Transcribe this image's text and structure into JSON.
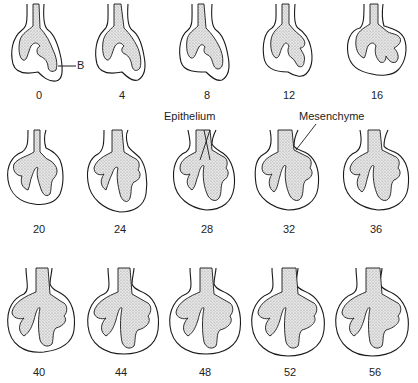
{
  "figure": {
    "panels": [
      {
        "label": "0",
        "row": 0,
        "col": 0,
        "stage": 0
      },
      {
        "label": "4",
        "row": 0,
        "col": 1,
        "stage": 1
      },
      {
        "label": "8",
        "row": 0,
        "col": 2,
        "stage": 2
      },
      {
        "label": "12",
        "row": 0,
        "col": 3,
        "stage": 3
      },
      {
        "label": "16",
        "row": 0,
        "col": 4,
        "stage": 4
      },
      {
        "label": "20",
        "row": 1,
        "col": 0,
        "stage": 5
      },
      {
        "label": "24",
        "row": 1,
        "col": 1,
        "stage": 6
      },
      {
        "label": "28",
        "row": 1,
        "col": 2,
        "stage": 7
      },
      {
        "label": "32",
        "row": 1,
        "col": 3,
        "stage": 8
      },
      {
        "label": "36",
        "row": 1,
        "col": 4,
        "stage": 9
      },
      {
        "label": "40",
        "row": 2,
        "col": 0,
        "stage": 10
      },
      {
        "label": "44",
        "row": 2,
        "col": 1,
        "stage": 11
      },
      {
        "label": "48",
        "row": 2,
        "col": 2,
        "stage": 12
      },
      {
        "label": "52",
        "row": 2,
        "col": 3,
        "stage": 13
      },
      {
        "label": "56",
        "row": 2,
        "col": 4,
        "stage": 14
      }
    ],
    "annotations": {
      "bud": "B",
      "epithelium": "Epithelium",
      "mesenchyme": "Mesenchyme"
    },
    "colors": {
      "outline": "#1a1a1a",
      "epithelium_fill": "#d9d9d9",
      "background": "#ffffff"
    }
  }
}
